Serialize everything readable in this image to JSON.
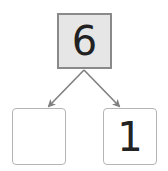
{
  "diagram": {
    "type": "number-bond",
    "whole": "6",
    "parts": [
      "",
      "1"
    ],
    "colors": {
      "whole_fill": "#e6e6e6",
      "whole_border": "#8a8a8a",
      "part_border": "#b5b5b5",
      "arrow": "#808080"
    }
  }
}
